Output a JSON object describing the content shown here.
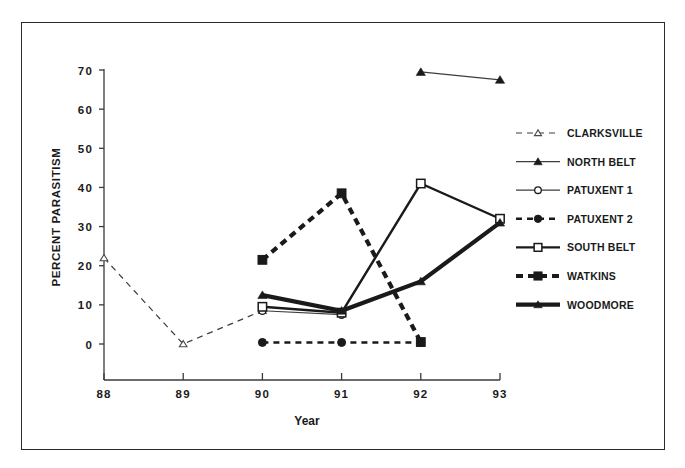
{
  "chart_data": {
    "type": "line",
    "title": "",
    "xlabel": "Year",
    "ylabel": "PERCENT PARASITISM",
    "x": [
      88,
      89,
      90,
      91,
      92,
      93
    ],
    "xticklabels": [
      "88",
      "89",
      "90",
      "91",
      "92",
      "93"
    ],
    "yticklabels": [
      "0",
      "10",
      "20",
      "30",
      "40",
      "50",
      "60",
      "70"
    ],
    "yticks": [
      0,
      10,
      20,
      30,
      40,
      50,
      60,
      70
    ],
    "xlim": [
      88,
      93
    ],
    "ylim": [
      0,
      70
    ],
    "grid": false,
    "legend_position": "right",
    "series": [
      {
        "name": "CLARKSVILLE",
        "marker": "triangle-open",
        "line": "dashed",
        "line_width": "thin",
        "points": [
          {
            "x": 88,
            "y": 22.0
          },
          {
            "x": 89,
            "y": 0.0
          },
          {
            "x": 90,
            "y": 8.5
          }
        ]
      },
      {
        "name": "NORTH BELT",
        "marker": "triangle-filled",
        "line": "solid",
        "line_width": "thin",
        "points": [
          {
            "x": 92,
            "y": 69.5
          },
          {
            "x": 93,
            "y": 67.5
          }
        ]
      },
      {
        "name": "PATUXENT 1",
        "marker": "circle-open",
        "line": "solid",
        "line_width": "thin",
        "points": [
          {
            "x": 90,
            "y": 8.5
          },
          {
            "x": 91,
            "y": 7.5
          }
        ]
      },
      {
        "name": "PATUXENT 2",
        "marker": "circle-filled",
        "line": "dashed",
        "line_width": "medium",
        "points": [
          {
            "x": 90,
            "y": 0.4
          },
          {
            "x": 91,
            "y": 0.4
          },
          {
            "x": 92,
            "y": 0.4
          }
        ]
      },
      {
        "name": "SOUTH BELT",
        "marker": "square-open",
        "line": "solid",
        "line_width": "medium",
        "points": [
          {
            "x": 90,
            "y": 9.5
          },
          {
            "x": 91,
            "y": 8.0
          },
          {
            "x": 92,
            "y": 41.0
          },
          {
            "x": 93,
            "y": 32.0
          }
        ]
      },
      {
        "name": "WATKINS",
        "marker": "square-filled",
        "line": "dashed",
        "line_width": "thick",
        "points": [
          {
            "x": 90,
            "y": 21.5
          },
          {
            "x": 91,
            "y": 38.5
          },
          {
            "x": 92,
            "y": 0.5
          }
        ]
      },
      {
        "name": "WOODMORE",
        "marker": "triangle-filled",
        "line": "solid",
        "line_width": "thick",
        "points": [
          {
            "x": 90,
            "y": 12.5
          },
          {
            "x": 91,
            "y": 8.5
          },
          {
            "x": 92,
            "y": 16.0
          },
          {
            "x": 93,
            "y": 31.0
          }
        ]
      }
    ]
  },
  "colors": {
    "ink": "#1a1a1a",
    "axis": "#3a3a3a",
    "frame": "#2b2b2b",
    "background": "#ffffff"
  }
}
